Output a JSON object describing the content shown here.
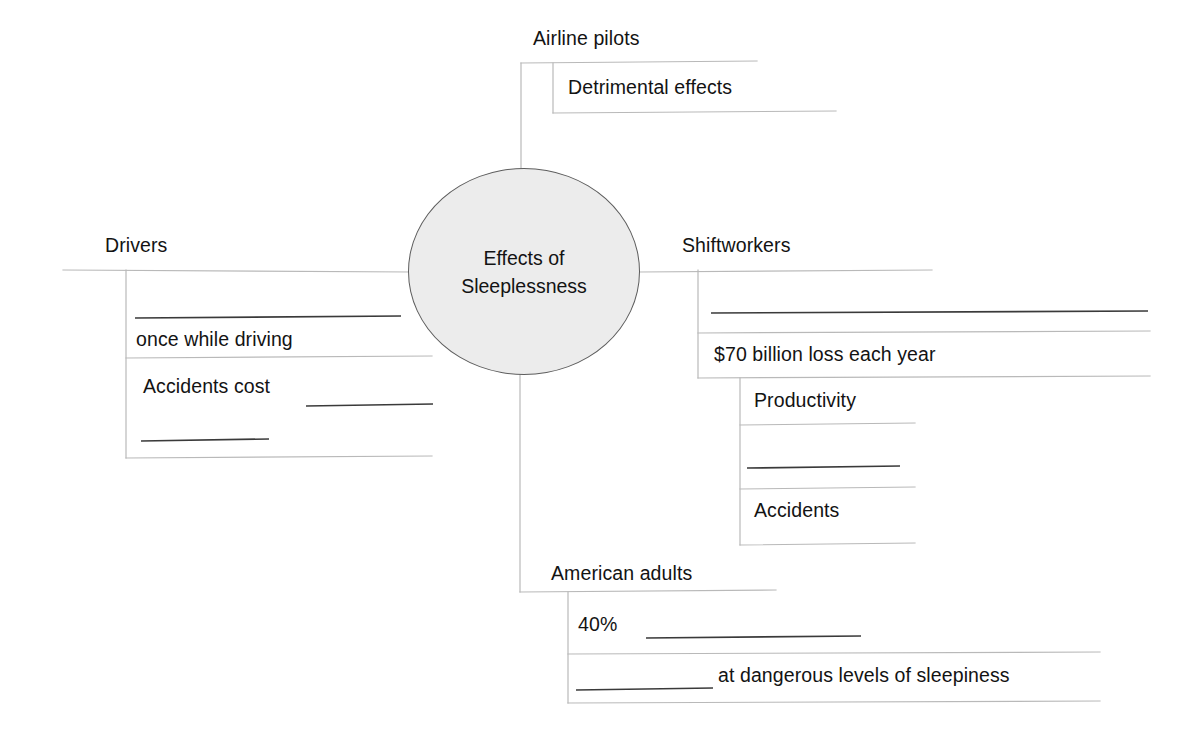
{
  "diagram": {
    "type": "concept-map",
    "title": "Effects of Sleeplessness",
    "center_node": {
      "label": "Effects of\nSleeplessness",
      "shape": "ellipse",
      "fill_color": "#ececec",
      "stroke_color": "#5d5d5d"
    },
    "colors": {
      "connector_line": "#b9b9b9",
      "blank_line": "#3a3a3a",
      "text": "#131313",
      "background": "#ffffff"
    },
    "branches": [
      {
        "id": "airline-pilots",
        "label": "Airline pilots",
        "direction": "top",
        "children": [
          {
            "id": "detrimental-effects",
            "label": "Detrimental effects",
            "blank": false
          }
        ]
      },
      {
        "id": "drivers",
        "label": "Drivers",
        "direction": "left",
        "children": [
          {
            "id": "drivers-blank-1",
            "label": "",
            "blank": true
          },
          {
            "id": "once-while-driving",
            "label": "once while driving",
            "blank": false
          },
          {
            "id": "accidents-cost",
            "label": "Accidents cost",
            "blank": true
          },
          {
            "id": "drivers-blank-2",
            "label": "",
            "blank": true
          }
        ]
      },
      {
        "id": "shiftworkers",
        "label": "Shiftworkers",
        "direction": "right",
        "children": [
          {
            "id": "shiftworkers-blank-1",
            "label": "",
            "blank": true
          },
          {
            "id": "seventy-billion-loss",
            "label": "$70 billion loss each year",
            "blank": false
          },
          {
            "id": "productivity",
            "label": "Productivity",
            "blank": false
          },
          {
            "id": "shiftworkers-blank-2",
            "label": "",
            "blank": true
          },
          {
            "id": "accidents",
            "label": "Accidents",
            "blank": false
          }
        ]
      },
      {
        "id": "american-adults",
        "label": "American adults",
        "direction": "bottom",
        "children": [
          {
            "id": "forty-percent",
            "label": "40%",
            "blank": true
          },
          {
            "id": "dangerous-levels",
            "label": "at dangerous levels of sleepiness",
            "blank": true
          }
        ]
      }
    ],
    "labels": {
      "airline_pilots": "Airline pilots",
      "detrimental_effects": "Detrimental effects",
      "drivers": "Drivers",
      "once_while_driving": "once while driving",
      "accidents_cost": "Accidents cost",
      "shiftworkers": "Shiftworkers",
      "seventy_billion": "$70 billion loss each year",
      "productivity": "Productivity",
      "accidents": "Accidents",
      "american_adults": "American adults",
      "forty_percent": "40%",
      "dangerous_levels": "at dangerous levels of sleepiness",
      "center_line_1": "Effects of",
      "center_line_2": "Sleeplessness"
    }
  }
}
